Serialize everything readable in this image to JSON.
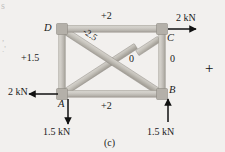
{
  "figure": {
    "caption": "(c)",
    "margin_mark": "+",
    "type": "truss free-body diagram with member forces"
  },
  "joints": [
    {
      "id": "D",
      "label": "D",
      "x": 62,
      "y": 29
    },
    {
      "id": "C",
      "label": "C",
      "x": 162,
      "y": 29
    },
    {
      "id": "A",
      "label": "A",
      "x": 62,
      "y": 94
    },
    {
      "id": "B",
      "label": "B",
      "x": 162,
      "y": 94
    }
  ],
  "members": [
    {
      "name": "top-chord-DC",
      "from": "D",
      "to": "C",
      "force": "+2",
      "kind": "tension"
    },
    {
      "name": "bottom-chord-AB",
      "from": "A",
      "to": "B",
      "force": "+2",
      "kind": "tension"
    },
    {
      "name": "left-post-AD",
      "from": "A",
      "to": "D",
      "force": "+1.5",
      "kind": "tension"
    },
    {
      "name": "right-post-BC",
      "from": "B",
      "to": "C",
      "force": "0",
      "kind": "zero-force"
    },
    {
      "name": "diagonal-DB",
      "from": "D",
      "to": "B",
      "force": "-2.5",
      "kind": "compression"
    },
    {
      "name": "diagonal-AC",
      "from": "A",
      "to": "C",
      "force": "0",
      "kind": "zero-force"
    }
  ],
  "member_labels": {
    "top": "+2",
    "bottom": "+2",
    "left": "+1.5",
    "right": "0",
    "diagonal_db": "-2.5",
    "diagonal_ac": "0"
  },
  "loads": [
    {
      "name": "load-at-C",
      "label": "2 kN",
      "at": "C",
      "direction": "right"
    },
    {
      "name": "load-at-A",
      "label": "2 kN",
      "at": "A",
      "direction": "left"
    }
  ],
  "reactions": [
    {
      "name": "reaction-at-A",
      "label": "1.5 kN",
      "at": "A",
      "direction": "down"
    },
    {
      "name": "reaction-at-B",
      "label": "1.5 kN",
      "at": "B",
      "direction": "up"
    }
  ],
  "colors": {
    "background": "#f2f0ee",
    "member_fill": "#c9c6c0",
    "member_shade": "#a8a49d",
    "member_light": "#dedbd5",
    "gusset": "#b4b0a9",
    "ink": "#1a1a1a"
  },
  "artifacts": {
    "top_left": "s",
    "mid_left": ",",
    "mid_left_2": ".'"
  }
}
